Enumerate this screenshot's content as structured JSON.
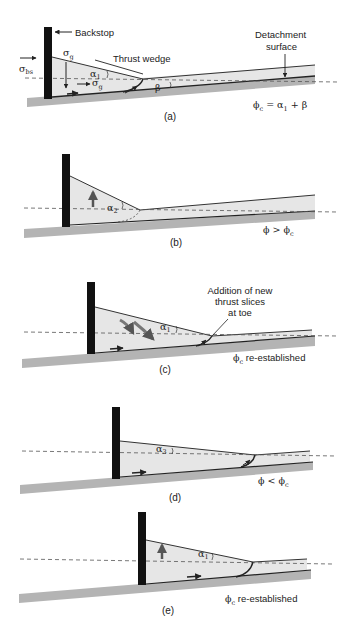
{
  "colors": {
    "wedge_fill": "#e6e6e6",
    "base_fill": "#b4b4b4",
    "backstop": "#111111",
    "line": "#333333",
    "dashed": "#555555",
    "arrow_gray": "#6e6e6e"
  },
  "panels": [
    {
      "id": "a",
      "caption": "(a)",
      "labels": {
        "backstop": "Backstop",
        "thrust_wedge": "Thrust wedge",
        "detachment_1": "Detachment",
        "detachment_2": "surface",
        "sigma_bs": "σ",
        "sigma_bs_sub": "bs",
        "sigma_g_top": "σ",
        "sigma_g_top_sub": "g",
        "sigma_g_mid": "σ",
        "sigma_g_mid_sub": "g",
        "alpha": "α",
        "alpha_sub": "1",
        "beta": "β",
        "condition": "ϕ",
        "condition_sub": "c",
        "condition_rest": " = α",
        "condition_rest_sub": "1",
        "condition_tail": " + β"
      }
    },
    {
      "id": "b",
      "caption": "(b)",
      "labels": {
        "alpha": "α",
        "alpha_sub": "2",
        "condition": "ϕ > ϕ",
        "condition_sub": "c"
      }
    },
    {
      "id": "c",
      "caption": "(c)",
      "labels": {
        "annotation_1": "Addition of new",
        "annotation_2": "thrust slices",
        "annotation_3": "at toe",
        "alpha": "α",
        "alpha_sub": "1",
        "condition": "ϕ",
        "condition_sub": "c",
        "condition_rest": " re-established"
      }
    },
    {
      "id": "d",
      "caption": "(d)",
      "labels": {
        "alpha": "α",
        "alpha_sub": "3",
        "condition": "ϕ < ϕ",
        "condition_sub": "c"
      }
    },
    {
      "id": "e",
      "caption": "(e)",
      "labels": {
        "alpha": "α",
        "alpha_sub": "1",
        "condition": "ϕ",
        "condition_sub": "c",
        "condition_rest": " re-established"
      }
    }
  ]
}
